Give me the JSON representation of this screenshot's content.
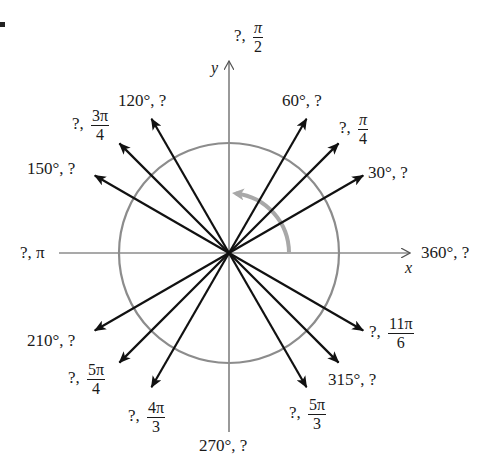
{
  "figure": {
    "type": "unit-circle-angle-diagram",
    "colors": {
      "axes": "#555555",
      "circle": "#8c8c8c",
      "rays": "#111111",
      "rotation_arrow": "#a8a8a8",
      "text": "#1a1a1a"
    },
    "origin": {
      "x": 229,
      "y": 253
    },
    "circle_radius": 110,
    "ray_length": 155,
    "axes": {
      "x_label": "x",
      "y_label": "y",
      "x_range_px": [
        59,
        411
      ],
      "y_range_px": [
        60,
        432
      ]
    },
    "rotation_arrow": {
      "radius": 60,
      "start_deg": 0,
      "end_deg": 86,
      "direction": "counterclockwise"
    },
    "labels": {
      "a90": {
        "prefix": "?, ",
        "num": "π",
        "den": "2"
      },
      "a60": {
        "text": "60°, ?"
      },
      "a45": {
        "prefix": "?, ",
        "num": "π",
        "den": "4"
      },
      "a30": {
        "text": "30°, ?"
      },
      "a120": {
        "text": "120°, ?"
      },
      "a135": {
        "prefix": "?, ",
        "num": "3π",
        "den": "4"
      },
      "a150": {
        "text": "150°, ?"
      },
      "a180": {
        "text": "?, π"
      },
      "a360": {
        "text": "360°, ?"
      },
      "a210": {
        "text": "210°, ?"
      },
      "a225": {
        "prefix": "?, ",
        "num": "5π",
        "den": "4"
      },
      "a240": {
        "prefix": "?, ",
        "num": "4π",
        "den": "3"
      },
      "a270": {
        "text": "270°, ?"
      },
      "a300": {
        "prefix": "?, ",
        "num": "5π",
        "den": "3"
      },
      "a315": {
        "text": "315°, ?"
      },
      "a330": {
        "prefix": "?, ",
        "num": "11π",
        "den": "6"
      }
    },
    "rays_deg": [
      30,
      45,
      60,
      120,
      135,
      150,
      210,
      225,
      240,
      300,
      315,
      330
    ]
  }
}
